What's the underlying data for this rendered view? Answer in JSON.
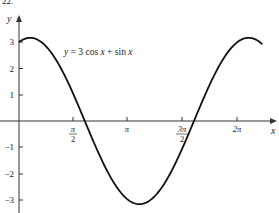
{
  "figure_number_fragment": "22.",
  "chart_data": {
    "type": "line",
    "title": "",
    "function_label": "y = 3 cos x + sin x",
    "function_parts": {
      "lhs": "y",
      "eq": " = 3 cos ",
      "x1": "x",
      "plus": " + sin ",
      "x2": "x"
    },
    "xlabel": "x",
    "ylabel": "y",
    "x_ticks": [
      {
        "value": 1.5708,
        "label_num": "π",
        "label_den": "2",
        "fraction": true
      },
      {
        "value": 3.1416,
        "label": "π",
        "fraction": false
      },
      {
        "value": 4.7124,
        "label_num": "3π",
        "label_den": "2",
        "fraction": true
      },
      {
        "value": 6.2832,
        "label": "2π",
        "fraction": false
      }
    ],
    "y_ticks": [
      {
        "value": 3,
        "label": "3"
      },
      {
        "value": 2,
        "label": "2"
      },
      {
        "value": 1,
        "label": "1"
      },
      {
        "value": -1,
        "label": "−1"
      },
      {
        "value": -2,
        "label": "−2"
      },
      {
        "value": -3,
        "label": "−3"
      }
    ],
    "xlim": [
      0,
      7.0
    ],
    "ylim": [
      -3.3,
      3.6
    ],
    "grid": false,
    "legend": "none",
    "series": [
      {
        "name": "y = 3 cos x + sin x",
        "x": [
          0,
          0.3217,
          0.7854,
          1.5708,
          1.8925,
          2.3562,
          3.1416,
          3.4633,
          3.927,
          4.7124,
          5.0341,
          5.4978,
          6.2832,
          6.6049,
          6.95
        ],
        "values": [
          3.0,
          3.162,
          2.828,
          1.0,
          0.0,
          -1.414,
          -3.0,
          -3.162,
          -2.828,
          -1.0,
          0.0,
          1.414,
          3.0,
          3.162,
          3.02
        ]
      }
    ],
    "key_points": {
      "y_intercept": [
        0,
        3
      ],
      "maximum": [
        0.3217,
        3.162
      ],
      "minimum": [
        3.4633,
        -3.162
      ],
      "zeros": [
        1.8925,
        5.0341
      ]
    }
  }
}
